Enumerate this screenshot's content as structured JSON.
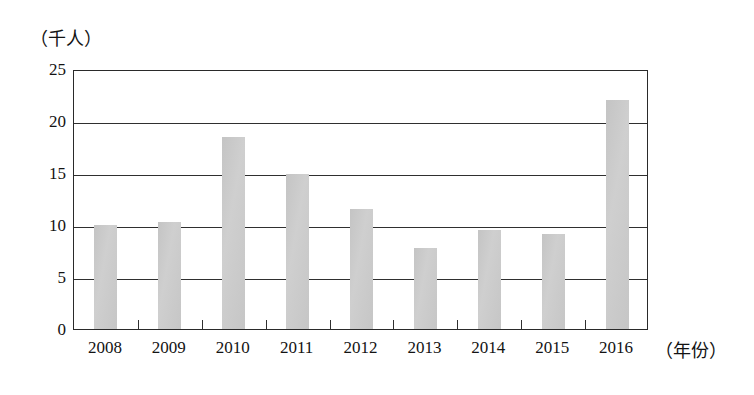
{
  "chart_data": {
    "type": "bar",
    "title": "",
    "xlabel": "（年份）",
    "ylabel": "（千人）",
    "categories": [
      "2008",
      "2009",
      "2010",
      "2011",
      "2012",
      "2013",
      "2014",
      "2015",
      "2016"
    ],
    "values": [
      10.0,
      10.3,
      18.5,
      14.9,
      11.5,
      7.8,
      9.5,
      9.1,
      22.0
    ],
    "ylim": [
      0,
      25
    ],
    "yticks": [
      0,
      5,
      10,
      15,
      20,
      25
    ],
    "ytick_labels": [
      "0",
      "5",
      "10",
      "15",
      "20",
      "25"
    ],
    "grid": true,
    "grid_axis": "y",
    "legend": "none",
    "series_name": "",
    "bar_color": "#c9c9c9",
    "axis_color": "#2f2f2f"
  }
}
